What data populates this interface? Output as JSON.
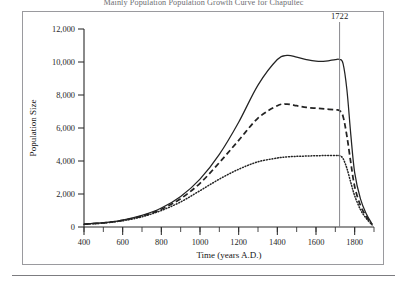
{
  "figure": {
    "title": "Mainly Population Population Growth Curve for Chapultec",
    "frame_border_color": "#9a9a9e"
  },
  "annotations": [
    {
      "name": "year-marker-1722",
      "label": "1722",
      "x": 1722
    }
  ],
  "chart_data": {
    "type": "line",
    "title": "Mainly Population Population Growth Curve for Chapultec",
    "xlabel": "Time (years A.D.)",
    "ylabel": "Population Size",
    "xlim": [
      400,
      1900
    ],
    "ylim": [
      0,
      12000
    ],
    "xticks": [
      400,
      600,
      800,
      1000,
      1200,
      1400,
      1600,
      1800
    ],
    "xtick_labels": [
      "400",
      "600",
      "800",
      "1000",
      "1200",
      "1400",
      "1600",
      "1800"
    ],
    "x_minor_tick_step": 100,
    "yticks": [
      0,
      2000,
      4000,
      6000,
      8000,
      10000,
      12000
    ],
    "ytick_labels": [
      "0",
      "2,000",
      "4,000",
      "6,000",
      "8,000",
      "10,000",
      "12,000"
    ],
    "grid": false,
    "legend": null,
    "annotation_lines": [
      {
        "label": "1722",
        "x": 1722,
        "orientation": "vertical"
      }
    ],
    "series": [
      {
        "name": "high-estimate",
        "style": "solid",
        "color": "#232323",
        "x": [
          400,
          500,
          600,
          700,
          800,
          900,
          1000,
          1100,
          1200,
          1300,
          1400,
          1450,
          1500,
          1550,
          1600,
          1650,
          1700,
          1722,
          1740,
          1760,
          1780,
          1800,
          1830,
          1860,
          1890
        ],
        "values": [
          180,
          260,
          420,
          700,
          1150,
          1850,
          2900,
          4400,
          6350,
          8600,
          10150,
          10400,
          10300,
          10150,
          10050,
          10050,
          10150,
          10150,
          9900,
          8300,
          5600,
          3300,
          1700,
          800,
          180
        ]
      },
      {
        "name": "middle-estimate",
        "style": "dashed",
        "color": "#232323",
        "x": [
          400,
          500,
          600,
          700,
          800,
          900,
          1000,
          1100,
          1200,
          1300,
          1400,
          1450,
          1500,
          1550,
          1600,
          1650,
          1700,
          1722,
          1740,
          1760,
          1780,
          1800,
          1830,
          1860,
          1890
        ],
        "values": [
          170,
          250,
          400,
          660,
          1080,
          1720,
          2650,
          3900,
          5250,
          6600,
          7350,
          7450,
          7350,
          7250,
          7200,
          7150,
          7100,
          7050,
          6700,
          5500,
          3900,
          2450,
          1300,
          650,
          150
        ]
      },
      {
        "name": "low-estimate",
        "style": "dotted",
        "color": "#232323",
        "x": [
          400,
          500,
          600,
          700,
          800,
          900,
          1000,
          1100,
          1200,
          1300,
          1400,
          1450,
          1500,
          1550,
          1600,
          1650,
          1700,
          1722,
          1740,
          1760,
          1780,
          1800,
          1830,
          1860,
          1890
        ],
        "values": [
          160,
          240,
          380,
          620,
          1000,
          1520,
          2200,
          2900,
          3500,
          3950,
          4180,
          4250,
          4280,
          4300,
          4320,
          4330,
          4330,
          4320,
          4150,
          3550,
          2700,
          1900,
          1050,
          520,
          130
        ]
      }
    ]
  }
}
